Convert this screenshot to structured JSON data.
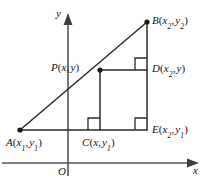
{
  "figure": {
    "colors": {
      "stroke": "#2b2b2b",
      "axis": "#4a4a4a",
      "text": "#141414",
      "background": "#ffffff"
    },
    "axes": {
      "y_label": "y",
      "x_label": "x",
      "origin_label": "O"
    },
    "points": [
      {
        "id": "A",
        "name": "point-a",
        "label_main": "A",
        "coord_text": "(x₁ , y₁)",
        "x_sym": "x",
        "x_sub": "1",
        "y_sym": "y",
        "y_sub": "1",
        "px": 20,
        "py": 130,
        "dot": true
      },
      {
        "id": "B",
        "name": "point-b",
        "label_main": "B",
        "coord_text": "(x₂ , y₂)",
        "x_sym": "x",
        "x_sub": "2",
        "y_sym": "y",
        "y_sub": "2",
        "px": 147,
        "py": 22,
        "dot": true
      },
      {
        "id": "P",
        "name": "point-p",
        "label_main": "P",
        "coord_text": "(x, y)",
        "x_sym": "x",
        "x_sub": "",
        "y_sym": "y",
        "y_sub": "",
        "px": 100,
        "py": 70,
        "dot": true
      },
      {
        "id": "C",
        "name": "point-c",
        "label_main": "C",
        "coord_text": "(x, y₁)",
        "x_sym": "x",
        "x_sub": "",
        "y_sym": "y",
        "y_sub": "1",
        "px": 100,
        "py": 130,
        "dot": false
      },
      {
        "id": "D",
        "name": "point-d",
        "label_main": "D",
        "coord_text": "(x₂ , y)",
        "x_sym": "x",
        "x_sub": "2",
        "y_sym": "y",
        "y_sub": "",
        "px": 147,
        "py": 70,
        "dot": false
      },
      {
        "id": "E",
        "name": "point-e",
        "label_main": "E",
        "coord_text": "(x₂ , y₁)",
        "x_sym": "x",
        "x_sub": "2",
        "y_sym": "y",
        "y_sub": "1",
        "px": 147,
        "py": 130,
        "dot": false
      }
    ],
    "right_angles": [
      {
        "name": "right-angle-mark-d",
        "at": "D"
      },
      {
        "name": "right-angle-mark-c",
        "at": "C"
      },
      {
        "name": "right-angle-mark-e",
        "at": "E"
      }
    ],
    "segments": [
      {
        "name": "segment-ab",
        "from": "A",
        "to": "B"
      },
      {
        "name": "segment-ae",
        "from": "A",
        "to": "E"
      },
      {
        "name": "segment-be",
        "from": "B",
        "to": "E"
      },
      {
        "name": "segment-pd",
        "from": "P",
        "to": "D"
      },
      {
        "name": "segment-pc",
        "from": "P",
        "to": "C"
      }
    ]
  }
}
